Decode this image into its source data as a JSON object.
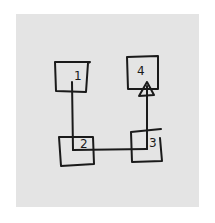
{
  "diagram": {
    "title": "",
    "background": "#e4e4e4",
    "ink_color": "#1a1a1a",
    "nodes": [
      {
        "id": "1",
        "label": "1",
        "shape": "trapezoid"
      },
      {
        "id": "2",
        "label": "2",
        "shape": "square"
      },
      {
        "id": "3",
        "label": "3",
        "shape": "square"
      },
      {
        "id": "4",
        "label": "4",
        "shape": "square"
      }
    ],
    "edges": [
      {
        "from": "1",
        "to": "2",
        "arrow": false
      },
      {
        "from": "2",
        "to": "3",
        "arrow": false
      },
      {
        "from": "3",
        "to": "4",
        "arrow": true
      }
    ]
  }
}
